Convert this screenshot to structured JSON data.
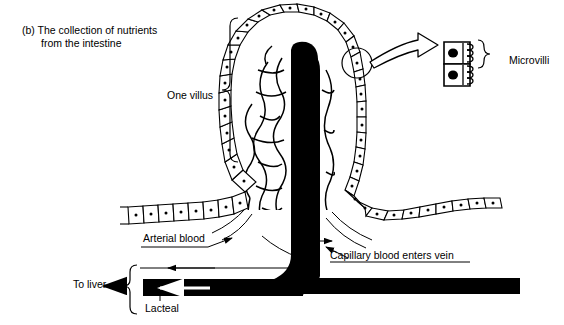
{
  "figure": {
    "part_letter": "(b)",
    "caption_line1": "The collection of nutrients",
    "caption_line2": "from the intestine"
  },
  "labels": {
    "one_villus": "One villus",
    "microvilli": "Microvilli",
    "arterial_blood": "Arterial blood",
    "capillary_blood": "Capillary blood enters vein",
    "to_liver": "To liver",
    "lacteal": "Lacteal"
  },
  "colors": {
    "ink": "#000000",
    "background": "#ffffff",
    "lacteal_fill": "#000000",
    "nucleus_fill": "#000000"
  },
  "diagram": {
    "type": "biological-schematic",
    "structures": [
      {
        "name": "epithelium",
        "description": "single row of boxed columnar cells with central nuclei outlining the villus and intestinal lining"
      },
      {
        "name": "lacteal",
        "description": "thick black lymphatic vessel running up the villus core and out to the left"
      },
      {
        "name": "capillary-network",
        "description": "irregular mesh of capillary loops filling the villus interior"
      },
      {
        "name": "microvilli-inset",
        "description": "two enlarged epithelial cells with nuclei and comb-like microvilli"
      },
      {
        "name": "callout-circle",
        "description": "circle on villus epithelium linked by a hollow arrow to the microvilli inset"
      }
    ],
    "flow_arrows": [
      {
        "name": "arterial-blood-arrow",
        "direction": "into villus base"
      },
      {
        "name": "capillary-to-vein-arrow",
        "direction": "out of villus to vein"
      },
      {
        "name": "vein-to-liver-arrow",
        "direction": "left"
      },
      {
        "name": "lacteal-flow-arrow",
        "direction": "left",
        "style": "white arrow inside black vessel"
      },
      {
        "name": "to-liver-arrow",
        "direction": "left"
      }
    ]
  }
}
